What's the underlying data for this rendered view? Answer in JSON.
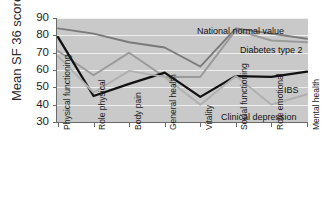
{
  "chart_data": {
    "type": "line",
    "title": "",
    "xlabel": "",
    "ylabel": "Mean SF 36 score",
    "ylim": [
      30,
      90
    ],
    "yticks": [
      30,
      40,
      50,
      60,
      70,
      80,
      90
    ],
    "grid": true,
    "legend_position": "inline-annotations",
    "categories": [
      "Physical functioning",
      "Role physical",
      "Body pain",
      "General health",
      "Vitality",
      "Social functioning",
      "Role emotional",
      "Mental health"
    ],
    "series": [
      {
        "name": "National normal value",
        "color": "#7a7a7a",
        "values": [
          84,
          81,
          76,
          73,
          62,
          84,
          81,
          78
        ]
      },
      {
        "name": "Diabetes type 2",
        "color": "#9a9a9a",
        "values": [
          71,
          57,
          70,
          56,
          56,
          83,
          77,
          76
        ]
      },
      {
        "name": "IBS",
        "color": "#111111",
        "values": [
          79,
          45,
          52,
          58.5,
          44.5,
          56.5,
          56,
          59
        ]
      },
      {
        "name": "Clinical depression",
        "color": "#b0b0b0",
        "values": [
          68,
          47,
          59.5,
          56,
          40,
          56.5,
          40,
          46
        ]
      }
    ],
    "annotations": [
      {
        "text": "National normal value",
        "series": "National normal value"
      },
      {
        "text": "Diabetes type 2",
        "series": "Diabetes type 2"
      },
      {
        "text": "IBS",
        "series": "IBS"
      },
      {
        "text": "Clinical depression",
        "series": "Clinical depression"
      }
    ]
  },
  "axis": {
    "y_title": "Mean SF 36 score",
    "y_tick_labels": [
      "90",
      "80",
      "70",
      "60",
      "50",
      "40",
      "30"
    ],
    "x_tick_labels": [
      "Physical functioning",
      "Role physical",
      "Body pain",
      "General health",
      "Vitality",
      "Social functioning",
      "Role emotional",
      "Mental health"
    ]
  },
  "annotations": {
    "national_normal_value": "National normal value",
    "diabetes_type_2": "Diabetes type 2",
    "ibs": "IBS",
    "clinical_depression": "Clinical depression"
  },
  "colors": {
    "plot_background": "#c9c9c9",
    "gridline": "#efefef",
    "axis": "#6a6a6a",
    "national_normal_value": "#7a7a7a",
    "diabetes_type_2": "#9a9a9a",
    "ibs": "#111111",
    "clinical_depression": "#b0b0b0"
  }
}
